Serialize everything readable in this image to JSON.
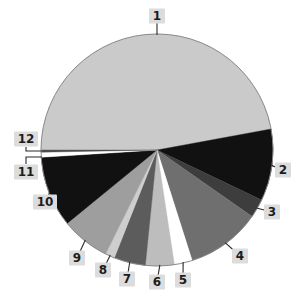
{
  "chart_data": {
    "type": "pie",
    "title": "",
    "labels": [
      "1",
      "2",
      "3",
      "4",
      "5",
      "6",
      "7",
      "8",
      "9",
      "10",
      "11",
      "12"
    ],
    "values": [
      47.1,
      10.0,
      2.6,
      10.4,
      2.5,
      4.0,
      4.4,
      1.3,
      6.8,
      9.9,
      0.7,
      0.3
    ],
    "unit": "percent",
    "start_angle_deg": 180,
    "direction": "clockwise",
    "colors": [
      "#cacaca",
      "#111111",
      "#3d3d3d",
      "#6f6f6f",
      "#ffffff",
      "#bdbdbd",
      "#5c5c5c",
      "#cecece",
      "#9e9e9e",
      "#111111",
      "#ffffff",
      "#4d4d4d"
    ],
    "rim_color": "#8a8a8a",
    "background": "#ffffff",
    "legend": "none",
    "geometry": {
      "cx": 157,
      "cy": 150,
      "r": 116
    },
    "callout": {
      "badge_bg": "#dcdcdc",
      "text_color": "#1c1c1c",
      "line_color": "#2b2b2b",
      "positions": [
        [
          157,
          16
        ],
        [
          283,
          170
        ],
        [
          272,
          212
        ],
        [
          240,
          256
        ],
        [
          183,
          280
        ],
        [
          157,
          282
        ],
        [
          127,
          279
        ],
        [
          103,
          270
        ],
        [
          77,
          258
        ],
        [
          45,
          202
        ],
        [
          26,
          172
        ],
        [
          26,
          139
        ]
      ],
      "anchor_angle_overrides": {
        "1": 90
      },
      "elbows": {
        "11": [
          [
            26,
            164
          ],
          [
            26,
            157
          ],
          [
            42,
            157
          ]
        ],
        "12": [
          [
            26,
            147
          ],
          [
            26,
            151
          ],
          [
            41,
            151
          ]
        ]
      }
    }
  }
}
